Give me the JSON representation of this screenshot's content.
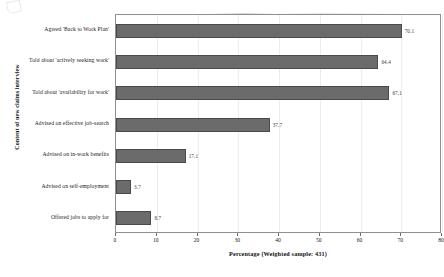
{
  "chart_data": {
    "type": "bar",
    "orientation": "horizontal",
    "title": "",
    "xlabel": "Percentage (Weighted sample: 431)",
    "ylabel": "Content of new claims interview",
    "xlim": [
      0,
      80
    ],
    "xticks": [
      "0",
      "10",
      "20",
      "30",
      "40",
      "50",
      "60",
      "70",
      "80"
    ],
    "grid": true,
    "legend": "none",
    "categories": [
      "Agreed 'Back to Work Plan'",
      "Told about 'actively seeking work'",
      "Told about 'availability for work'",
      "Advised on effective job-search",
      "Advised on in-work benefits",
      "Advised on self-employment",
      "Offered jobs to apply for"
    ],
    "values": [
      70.1,
      64.4,
      67.1,
      37.7,
      17.1,
      3.7,
      8.7
    ],
    "value_labels": [
      "70.1",
      "64.4",
      "67.1",
      "37.7",
      "17.1",
      "3.7",
      "8.7"
    ],
    "bar_color": "#6b6b6b",
    "bar_edge_color": "#4a4a4a"
  }
}
